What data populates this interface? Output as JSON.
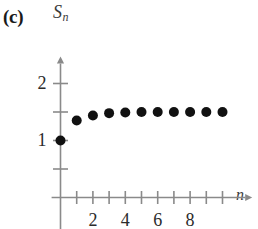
{
  "figure": {
    "panel_label": "(c)",
    "background_color": "#ffffff",
    "axis_color": "#8a8a8a",
    "point_color": "#111111",
    "text_color": "#2b2b2b"
  },
  "axes": {
    "y": {
      "title": "S",
      "title_subscript": "n",
      "labels": [
        {
          "text": "2",
          "value": 2
        },
        {
          "text": "1",
          "value": 1
        }
      ],
      "tick_values": [
        0.5,
        1,
        1.5,
        2
      ],
      "range": [
        0,
        2.35
      ],
      "arrow": true
    },
    "x": {
      "title": "n",
      "labels": [
        {
          "text": "2",
          "value": 2
        },
        {
          "text": "4",
          "value": 4
        },
        {
          "text": "6",
          "value": 6
        },
        {
          "text": "8",
          "value": 8
        }
      ],
      "tick_values": [
        1,
        2,
        3,
        4,
        5,
        6,
        7,
        8,
        9,
        10
      ],
      "range": [
        -0.55,
        11.4
      ],
      "arrow": true
    }
  },
  "chart_data": {
    "type": "scatter",
    "title": "(c)",
    "xlabel": "n",
    "ylabel": "S_n",
    "grid": false,
    "legend": null,
    "xlim": [
      -0.55,
      11.4
    ],
    "ylim": [
      0,
      2.35
    ],
    "x": [
      0,
      1,
      2,
      3,
      4,
      5,
      6,
      7,
      8,
      9,
      10
    ],
    "y": [
      1.0,
      1.35,
      1.44,
      1.48,
      1.49,
      1.5,
      1.5,
      1.5,
      1.5,
      1.5,
      1.5
    ],
    "series": [
      {
        "name": "partial sums",
        "marker": "filled-circle",
        "values": [
          1.0,
          1.35,
          1.44,
          1.48,
          1.49,
          1.5,
          1.5,
          1.5,
          1.5,
          1.5,
          1.5
        ]
      }
    ],
    "annotations": []
  }
}
